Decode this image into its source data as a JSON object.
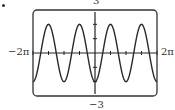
{
  "chart_data": {
    "type": "line",
    "title": "",
    "function_description": "y = -2cos(2x)",
    "xlabel": "",
    "ylabel": "",
    "xlim_label": [
      "-2π",
      "2π"
    ],
    "ylim_label": [
      "-3",
      "3"
    ],
    "xlim": [
      -6.2832,
      6.2832
    ],
    "ylim": [
      -3,
      3
    ],
    "grid": false,
    "x_ticks_count_each_side": 4,
    "amplitude": 2,
    "period": 3.1416,
    "series": [
      {
        "name": "y",
        "x": [
          -6.2832,
          -5.4978,
          -4.7124,
          -3.927,
          -3.1416,
          -2.3562,
          -1.5708,
          -0.7854,
          0,
          0.7854,
          1.5708,
          2.3562,
          3.1416,
          3.927,
          4.7124,
          5.4978,
          6.2832
        ],
        "y": [
          -2,
          0,
          2,
          0,
          -2,
          0,
          2,
          0,
          -2,
          0,
          2,
          0,
          -2,
          0,
          2,
          0,
          -2
        ]
      }
    ]
  },
  "labels": {
    "ymax": "3",
    "ymin": "−3",
    "xmin": "−2π",
    "xmax": "2π"
  },
  "colors": {
    "curve": "#2a2a2a",
    "frame": "#333333",
    "axis": "#222222"
  }
}
